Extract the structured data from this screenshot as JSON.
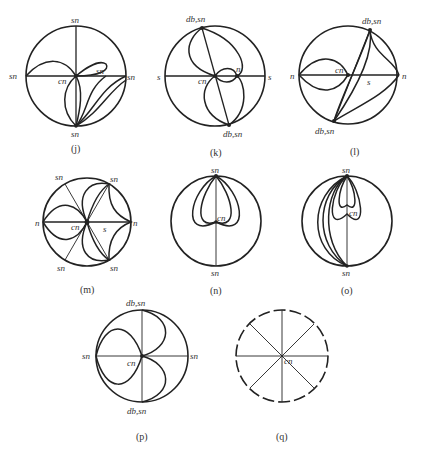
{
  "figure": {
    "panels": [
      {
        "id": "j",
        "caption": "(j)",
        "labels": {
          "top": "sn",
          "left": "sn",
          "right": "sn",
          "bottom": "sn",
          "center": "cn",
          "inner": "sn"
        }
      },
      {
        "id": "k",
        "caption": "(k)",
        "labels": {
          "top": "db,sn",
          "left": "s",
          "right": "s",
          "bottom": "db,sn",
          "center": "cn",
          "inner": "n"
        }
      },
      {
        "id": "l",
        "caption": "(l)",
        "labels": {
          "top": "db,sn",
          "left": "n",
          "right": "n",
          "bottom": "db,sn",
          "center": "cn",
          "inner": "s"
        }
      },
      {
        "id": "m",
        "caption": "(m)",
        "labels": {
          "top_left": "sn",
          "top_right": "sn",
          "left": "n",
          "right": "n",
          "bottom_left": "sn",
          "bottom_right": "sn",
          "center": "cn",
          "inner": "s"
        }
      },
      {
        "id": "n",
        "caption": "(n)",
        "labels": {
          "top": "sn",
          "bottom": "sn",
          "center": "cn"
        }
      },
      {
        "id": "o",
        "caption": "(o)",
        "labels": {
          "top": "sn",
          "bottom": "sn",
          "center": "cn"
        }
      },
      {
        "id": "p",
        "caption": "(p)",
        "labels": {
          "top": "db,sn",
          "left": "sn",
          "right": "sn",
          "bottom": "db,sn",
          "center": "cn"
        }
      },
      {
        "id": "q",
        "caption": "(q)",
        "labels": {
          "center": "cn"
        }
      }
    ]
  }
}
